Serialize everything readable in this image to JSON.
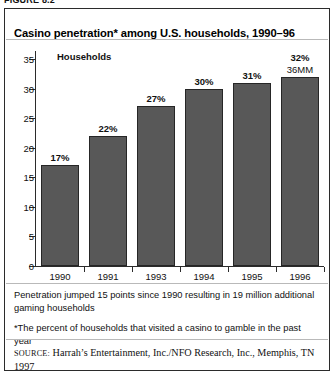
{
  "figure": {
    "caption": "FIGURE 8.2"
  },
  "chart_data": {
    "type": "bar",
    "title": "Casino penetration* among U.S. households, 1990–96",
    "series_label": "Households",
    "categories": [
      "1990",
      "1991",
      "1993",
      "1994",
      "1995",
      "1996"
    ],
    "values": [
      17,
      22,
      27,
      30,
      31,
      32
    ],
    "value_labels": [
      "17%",
      "22%",
      "27%",
      "30%",
      "31%",
      "32%"
    ],
    "annotations": [
      {
        "category": "1996",
        "text": "36MM"
      }
    ],
    "xlabel": "",
    "ylabel": "",
    "ylim": [
      0,
      35
    ],
    "yticks": [
      0,
      5,
      10,
      15,
      20,
      25,
      30,
      35
    ],
    "ytick_labels": [
      "0",
      "5",
      "10",
      "15",
      "20",
      "25",
      "30",
      "35"
    ],
    "grid": false,
    "legend": "none",
    "bar_color": "#585858",
    "bar_edge_color": "#262626"
  },
  "notes": {
    "note1": "Penetration jumped 15 points since 1990 resulting in 19 million additional gaming households",
    "note2": "*The percent of households that visited a casino to gamble in the past year"
  },
  "source": {
    "keyword": "SOURCE:",
    "text": " Harrah’s Entertainment, Inc./NFO Research, Inc., Memphis, TN 1997"
  }
}
